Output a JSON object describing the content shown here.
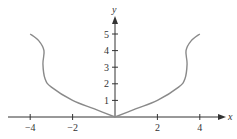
{
  "chart_data": {
    "type": "line",
    "title": "",
    "xlabel": "x",
    "ylabel": "y",
    "xlim": [
      -4.5,
      5
    ],
    "ylim": [
      0,
      5.8
    ],
    "x_ticks": [
      -4,
      -2,
      2,
      4
    ],
    "x_tick_labels": [
      "−4",
      "−2",
      "2",
      "4"
    ],
    "y_ticks": [
      1,
      2,
      3,
      4,
      5
    ],
    "y_tick_labels": [
      "1",
      "2",
      "3",
      "4",
      "5"
    ],
    "grid": false,
    "legend": null,
    "series": [
      {
        "name": "curve",
        "color": "#888888",
        "points": [
          [
            -4.0,
            5.0
          ],
          [
            -3.6,
            4.6
          ],
          [
            -3.35,
            4.0
          ],
          [
            -3.4,
            3.2
          ],
          [
            -3.3,
            2.3
          ],
          [
            -3.0,
            1.8
          ],
          [
            -2.0,
            1.0
          ],
          [
            -1.0,
            0.5
          ],
          [
            0.0,
            0.0
          ],
          [
            1.0,
            0.5
          ],
          [
            2.0,
            1.0
          ],
          [
            3.0,
            1.8
          ],
          [
            3.3,
            2.3
          ],
          [
            3.4,
            3.2
          ],
          [
            3.35,
            4.0
          ],
          [
            3.6,
            4.6
          ],
          [
            4.0,
            5.0
          ]
        ]
      }
    ]
  },
  "colors": {
    "axis": "#333333",
    "curve": "#8a8a8a"
  }
}
